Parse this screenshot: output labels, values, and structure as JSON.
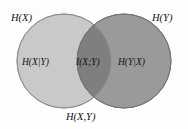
{
  "figure": {
    "type": "venn-diagram",
    "background_color": "#fdfdfd"
  },
  "sets": {
    "left": {
      "outer_label": "H(X)",
      "region_label": "H(X|Y)",
      "fill_color": "#c9c9c9",
      "stroke_color": "#8a8a8a"
    },
    "right": {
      "outer_label": "H(Y)",
      "region_label": "H(Y|X)",
      "fill_color": "#9a9a9a",
      "stroke_color": "#6f6f6f"
    },
    "intersection": {
      "region_label": "I(X;Y)",
      "fill_color": "#7f7f7f"
    },
    "union": {
      "label": "H(X,Y)"
    }
  },
  "labels": [
    {
      "id": "label-hx",
      "text": "H(X)",
      "role": "outer-left-set-label"
    },
    {
      "id": "label-hy",
      "text": "H(Y)",
      "role": "outer-right-set-label"
    },
    {
      "id": "label-hxy-cond",
      "text": "H(X|Y)",
      "role": "left-only-region-label"
    },
    {
      "id": "label-ixy",
      "text": "I(X;Y)",
      "role": "intersection-region-label"
    },
    {
      "id": "label-hyx-cond",
      "text": "H(Y|X)",
      "role": "right-only-region-label"
    },
    {
      "id": "label-joint",
      "text": "H(X,Y)",
      "role": "union-label"
    }
  ],
  "geometry": {
    "left_circle": {
      "cx": 64,
      "cy": 61,
      "r": 47
    },
    "right_circle": {
      "cx": 124,
      "cy": 61,
      "r": 47
    }
  }
}
